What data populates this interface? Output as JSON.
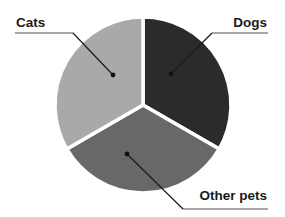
{
  "chart_data": {
    "type": "pie",
    "title": "",
    "categories": [
      "Dogs",
      "Other pets",
      "Cats"
    ],
    "values": [
      33.3,
      33.3,
      33.3
    ],
    "colors": [
      "#2b2b2b",
      "#686868",
      "#a9a9a9"
    ],
    "legend": "none (leader-line callout labels)",
    "labels": [
      {
        "text": "Cats",
        "position": "top-left"
      },
      {
        "text": "Dogs",
        "position": "top-right"
      },
      {
        "text": "Other pets",
        "position": "bottom-right"
      }
    ],
    "slice_separator_color": "#ffffff"
  },
  "labels": {
    "cats": "Cats",
    "dogs": "Dogs",
    "other_pets": "Other pets"
  },
  "colors": {
    "dogs": "#2b2b2b",
    "other_pets": "#686868",
    "cats": "#a9a9a9",
    "leader_line": "#1a1a1a",
    "baseline_rule": "#8a8a8a",
    "background": "#ffffff"
  }
}
